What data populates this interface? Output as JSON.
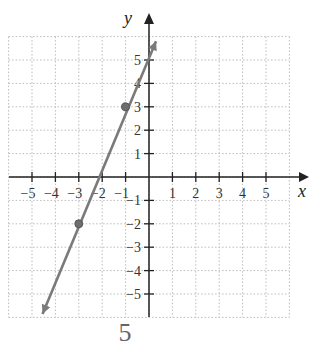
{
  "chart_data": {
    "type": "line",
    "title": "",
    "xlabel": "x",
    "ylabel": "y",
    "xlim": [
      -6,
      6
    ],
    "ylim": [
      -6,
      6
    ],
    "grid": true,
    "x_ticks": [
      -5,
      -4,
      -3,
      -2,
      -1,
      1,
      2,
      3,
      4,
      5
    ],
    "y_ticks": [
      -5,
      -4,
      -3,
      -2,
      -1,
      1,
      2,
      3,
      4,
      5
    ],
    "x_tick_labels": [
      "−5",
      "−4",
      "−3",
      "−2",
      "−1",
      "1",
      "2",
      "3",
      "4",
      "5"
    ],
    "y_tick_labels": [
      "−5",
      "−4",
      "−3",
      "−2",
      "−1",
      "1",
      "2",
      "3",
      "4",
      "5"
    ],
    "series": [
      {
        "name": "line",
        "color": "#7a7a7a",
        "line_start": [
          -4.55,
          -5.85
        ],
        "line_end": [
          0.3,
          5.8
        ],
        "points": [
          {
            "x": -3,
            "y": -2
          },
          {
            "x": -1,
            "y": 3
          }
        ],
        "slope": 2.5,
        "intercept": 5.5
      }
    ],
    "caption": "5"
  },
  "labels": {
    "x_axis": "x",
    "y_axis": "y",
    "caption": "5"
  }
}
